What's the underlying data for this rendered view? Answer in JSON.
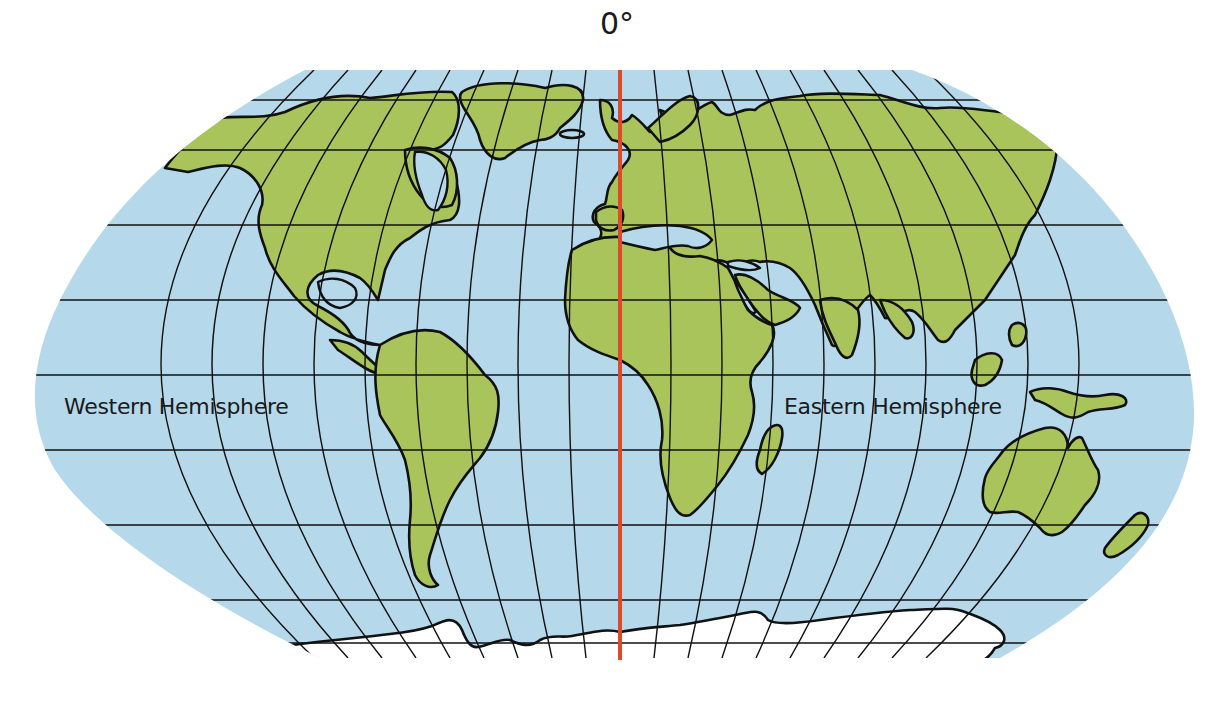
{
  "map": {
    "type": "world-map",
    "projection": "Robinson-style",
    "prime_meridian_label": "0°",
    "hemisphere_labels": {
      "west": "Western Hemisphere",
      "east": "Eastern Hemisphere"
    },
    "colors": {
      "ocean": "#b5d8ea",
      "land": "#a9c45a",
      "ice": "#ffffff",
      "outline": "#111111",
      "prime_meridian": "#e0482a",
      "background": "#ffffff"
    },
    "features": {
      "continents": [
        "North America",
        "Greenland",
        "South America",
        "Europe",
        "Asia",
        "Africa",
        "Madagascar",
        "Australia",
        "New Guinea",
        "New Zealand",
        "Antarctica",
        "Japan",
        "Indonesia islands",
        "Iceland"
      ],
      "graticule": {
        "parallels_count": 10,
        "meridians": "every 20 degrees",
        "prime_meridian_highlighted": true
      }
    }
  }
}
